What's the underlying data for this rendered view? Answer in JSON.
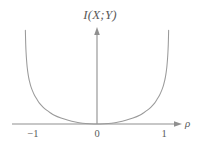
{
  "figure": {
    "background_color": "#ffffff",
    "curve_color": "#9a9a9a",
    "axis_color": "#8f8f8f",
    "text_color": "#5a5a5a"
  },
  "labels": {
    "axis_title": "I(X;Y)",
    "xaxis_label": "ρ",
    "tick_neg_one": "−1",
    "tick_zero": "0",
    "tick_one": "1"
  },
  "chart_data": {
    "type": "line",
    "title": "I(X;Y)",
    "xlabel": "ρ",
    "ylabel": "I(X;Y)",
    "xlim": [
      -1.12,
      1.12
    ],
    "ylim": [
      0,
      3.4
    ],
    "grid": false,
    "legend": null,
    "xticks": [
      -1,
      0,
      1
    ],
    "xticklabels": [
      "−1",
      "0",
      "1"
    ],
    "yticks": [],
    "yticklabels": [],
    "annotations": [],
    "series": [
      {
        "name": "I(X;Y) = -0.5*log2(1 - rho^2)",
        "x": [
          -0.995,
          -0.99,
          -0.985,
          -0.98,
          -0.97,
          -0.96,
          -0.95,
          -0.94,
          -0.92,
          -0.9,
          -0.87,
          -0.84,
          -0.8,
          -0.75,
          -0.7,
          -0.65,
          -0.6,
          -0.5,
          -0.4,
          -0.3,
          -0.2,
          -0.1,
          0.0,
          0.1,
          0.2,
          0.3,
          0.4,
          0.5,
          0.6,
          0.65,
          0.7,
          0.75,
          0.8,
          0.84,
          0.87,
          0.9,
          0.92,
          0.94,
          0.95,
          0.96,
          0.97,
          0.98,
          0.985,
          0.99,
          0.995
        ],
        "y": [
          3.32,
          2.82,
          2.53,
          2.32,
          2.02,
          1.82,
          1.66,
          1.54,
          1.34,
          1.2,
          1.03,
          0.9,
          0.74,
          0.6,
          0.49,
          0.4,
          0.32,
          0.21,
          0.13,
          0.07,
          0.03,
          0.01,
          0.0,
          0.01,
          0.03,
          0.07,
          0.13,
          0.21,
          0.32,
          0.4,
          0.49,
          0.6,
          0.74,
          0.9,
          1.03,
          1.2,
          1.34,
          1.54,
          1.66,
          1.82,
          2.02,
          2.32,
          2.53,
          2.82,
          3.32
        ]
      }
    ]
  }
}
